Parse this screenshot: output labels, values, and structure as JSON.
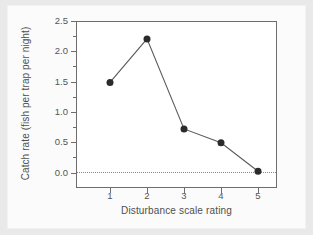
{
  "figure": {
    "background_color": "#e9e9e9",
    "paper_color": "#fbfbfb",
    "frame_color": "#6d6d6d",
    "marker_color": "#2b2b2b",
    "line_color": "#5a5a5a",
    "zero_line_color": "#8a8a8a"
  },
  "chart_data": {
    "type": "line",
    "title": "",
    "xlabel": "Disturbance scale rating",
    "ylabel": "Catch rate (fish per trap per night)",
    "x": [
      1,
      2,
      3,
      4,
      5
    ],
    "values": [
      1.5,
      2.22,
      0.73,
      0.5,
      0.03
    ],
    "series": [
      {
        "name": "Catch rate",
        "x": [
          1,
          2,
          3,
          4,
          5
        ],
        "values": [
          1.5,
          2.22,
          0.73,
          0.5,
          0.03
        ]
      }
    ],
    "xlim": [
      0.5,
      5.5
    ],
    "ylim": [
      -0.22,
      2.55
    ],
    "xticks": [
      1,
      2,
      3,
      4,
      5
    ],
    "xtick_labels": [
      "1",
      "2",
      "3",
      "4",
      "5"
    ],
    "yticks": [
      0.0,
      0.5,
      1.0,
      1.5,
      2.0,
      2.5
    ],
    "ytick_labels": [
      "0.0",
      "0.5",
      "1.0",
      "1.5",
      "2.0",
      "2.5"
    ],
    "yticks_minor": [
      0.25,
      0.75,
      1.25,
      1.75,
      2.25
    ],
    "grid": false,
    "legend": null,
    "annotations": [
      {
        "type": "reference-line",
        "orientation": "horizontal",
        "value": 0.0,
        "style": "dotted"
      }
    ],
    "marker": "filled-circle",
    "marker_size": 7
  }
}
